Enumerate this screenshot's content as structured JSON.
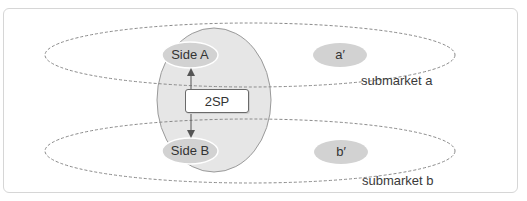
{
  "diagram": {
    "platform": {
      "label": "2SP"
    },
    "nodes": {
      "side_a": {
        "label": "Side A"
      },
      "side_b": {
        "label": "Side B"
      },
      "a_prime": {
        "label": "a′"
      },
      "b_prime": {
        "label": "b′"
      }
    },
    "submarkets": [
      {
        "label": "submarket a"
      },
      {
        "label": "submarket b"
      }
    ],
    "colors": {
      "platform_fill": "#e6e6e6",
      "node_fill": "#d2d2d2",
      "dashed_stroke": "#8a8a8a",
      "frame_border": "#d6d6d6"
    }
  }
}
